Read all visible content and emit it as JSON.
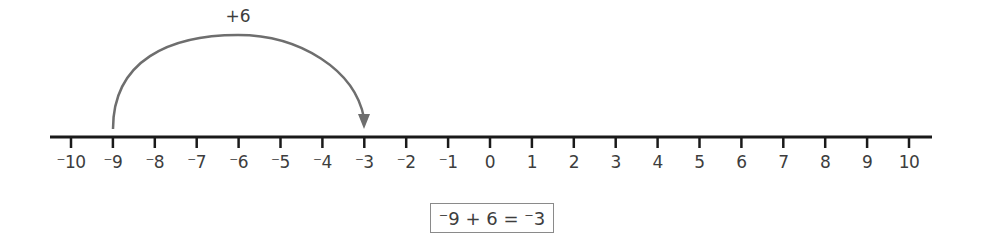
{
  "number_line": {
    "min": -10,
    "max": 10,
    "step": 1,
    "ticks": [
      {
        "value": -10,
        "label": "⁻10"
      },
      {
        "value": -9,
        "label": "⁻9"
      },
      {
        "value": -8,
        "label": "⁻8"
      },
      {
        "value": -7,
        "label": "⁻7"
      },
      {
        "value": -6,
        "label": "⁻6"
      },
      {
        "value": -5,
        "label": "⁻5"
      },
      {
        "value": -4,
        "label": "⁻4"
      },
      {
        "value": -3,
        "label": "⁻3"
      },
      {
        "value": -2,
        "label": "⁻2"
      },
      {
        "value": -1,
        "label": "⁻1"
      },
      {
        "value": 0,
        "label": "0"
      },
      {
        "value": 1,
        "label": "1"
      },
      {
        "value": 2,
        "label": "2"
      },
      {
        "value": 3,
        "label": "3"
      },
      {
        "value": 4,
        "label": "4"
      },
      {
        "value": 5,
        "label": "5"
      },
      {
        "value": 6,
        "label": "6"
      },
      {
        "value": 7,
        "label": "7"
      },
      {
        "value": 8,
        "label": "8"
      },
      {
        "value": 9,
        "label": "9"
      },
      {
        "value": 10,
        "label": "10"
      }
    ],
    "line_color": "#1a1a1a"
  },
  "jump": {
    "from": -9,
    "to": -3,
    "label": "+6",
    "arrow_color": "#6e6e6e"
  },
  "equation": {
    "text": "⁻9 + 6 = ⁻3"
  }
}
